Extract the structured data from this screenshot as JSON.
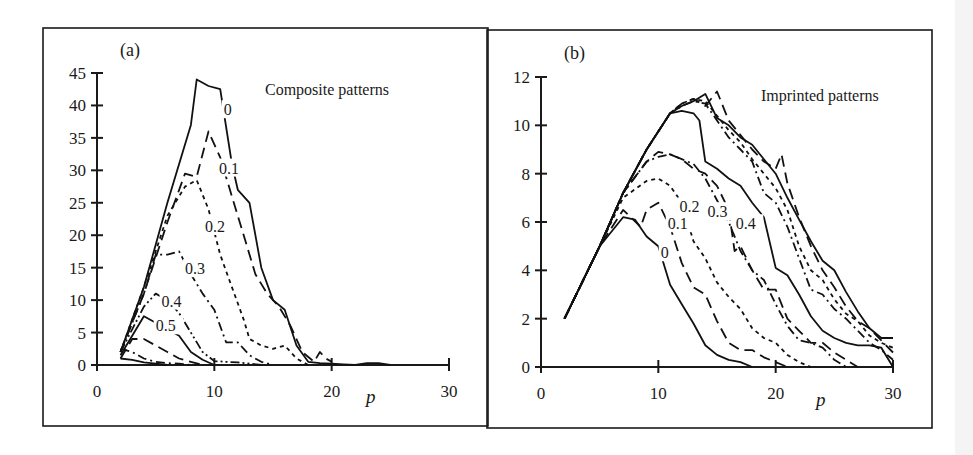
{
  "chart_data": [
    {
      "panel": "(a)",
      "type": "line",
      "title": "Composite patterns",
      "xlabel": "p",
      "ylabel": "",
      "xlim": [
        0,
        30
      ],
      "ylim": [
        0,
        45
      ],
      "xticks": [
        0,
        10,
        20,
        30
      ],
      "yticks": [
        0,
        5,
        10,
        15,
        20,
        25,
        30,
        35,
        40,
        45
      ],
      "grid": false,
      "legend": "inline curve labels",
      "series": [
        {
          "name": "0",
          "style": "solid",
          "label_pos": [
            10.8,
            38.5
          ],
          "x": [
            2,
            4,
            6,
            8,
            8.5,
            9.5,
            10.5,
            11.5,
            12,
            13,
            14,
            15,
            16,
            17,
            18,
            19,
            20,
            21,
            22,
            23,
            24,
            25
          ],
          "y": [
            2,
            12,
            25,
            37,
            44,
            43,
            42.5,
            31,
            27,
            25,
            15,
            10,
            8.5,
            3,
            0.5,
            0.3,
            0.2,
            0.1,
            0,
            0.3,
            0.3,
            0
          ]
        },
        {
          "name": "0.1",
          "style": "long-dash",
          "label_pos": [
            10.4,
            29.5
          ],
          "x": [
            2,
            4,
            6,
            7.5,
            8.5,
            9.5,
            10.5,
            11.5,
            12.5,
            13.5,
            14.5,
            15.5,
            16.5,
            17.5,
            18.5,
            19,
            19.5,
            20
          ],
          "y": [
            2,
            11,
            22,
            29.5,
            29,
            36,
            32,
            26,
            20,
            14,
            11,
            9,
            6,
            2,
            0.5,
            2,
            1,
            0.5
          ]
        },
        {
          "name": "0.2",
          "style": "short-dash",
          "label_pos": [
            9.2,
            20.5
          ],
          "x": [
            2,
            4,
            6,
            7.5,
            8.5,
            9.5,
            10.5,
            11.5,
            12.5,
            13,
            14,
            15,
            16,
            17,
            18
          ],
          "y": [
            2,
            12,
            23,
            27.5,
            28.5,
            24,
            17,
            12,
            7,
            4,
            3,
            2.5,
            3,
            1,
            0
          ]
        },
        {
          "name": "0.3",
          "style": "dash-dot",
          "label_pos": [
            7.5,
            14
          ],
          "x": [
            2,
            4,
            5,
            6,
            7,
            8,
            9,
            10,
            11,
            12,
            13,
            14,
            15
          ],
          "y": [
            2,
            11,
            17,
            17,
            17.5,
            14,
            11,
            8.5,
            3.5,
            3.5,
            1.5,
            0.5,
            0
          ]
        },
        {
          "name": "0.4",
          "style": "dash-dot-dot",
          "label_pos": [
            5.5,
            9
          ],
          "x": [
            2,
            3,
            4,
            5,
            6,
            7,
            8,
            9,
            10,
            11,
            12,
            13,
            14
          ],
          "y": [
            2,
            5.5,
            9,
            11,
            10,
            8,
            5,
            2,
            0.6,
            0.5,
            0.4,
            0.2,
            0
          ]
        },
        {
          "name": "0.5",
          "style": "solid",
          "label_pos": [
            5.0,
            5.2
          ],
          "x": [
            2,
            3,
            4,
            5,
            6,
            7,
            8,
            9,
            10
          ],
          "y": [
            1.5,
            4.5,
            7.5,
            6.5,
            5.5,
            4.5,
            2,
            0.8,
            0
          ]
        },
        {
          "name": "0.6",
          "style": "long-dash",
          "label_pos": null,
          "x": [
            2,
            3,
            4,
            5,
            6,
            7,
            8,
            9
          ],
          "y": [
            1,
            4,
            4,
            3,
            2,
            1,
            0.5,
            0
          ]
        },
        {
          "name": "0.7",
          "style": "dash-dot",
          "label_pos": null,
          "x": [
            2,
            3,
            4,
            5,
            6,
            7,
            8
          ],
          "y": [
            2.5,
            2,
            1,
            0.5,
            0.3,
            0.2,
            0
          ]
        },
        {
          "name": "0.8",
          "style": "solid",
          "label_pos": null,
          "x": [
            2,
            3,
            4,
            5,
            6
          ],
          "y": [
            1,
            0.8,
            0.4,
            0.2,
            0
          ]
        }
      ]
    },
    {
      "panel": "(b)",
      "type": "line",
      "title": "Imprinted patterns",
      "xlabel": "p",
      "ylabel": "",
      "xlim": [
        0,
        30
      ],
      "ylim": [
        0,
        12
      ],
      "xticks": [
        0,
        10,
        20,
        30
      ],
      "yticks": [
        0,
        2,
        4,
        6,
        8,
        10,
        12
      ],
      "grid": false,
      "legend": "inline curve labels",
      "series": [
        {
          "name": "0",
          "style": "solid",
          "label_pos": [
            10.2,
            4.5
          ],
          "x": [
            2,
            5,
            7,
            8,
            9,
            10,
            11,
            12,
            13,
            14,
            15,
            16,
            17,
            18
          ],
          "y": [
            2,
            5,
            6.2,
            6.1,
            5.4,
            5,
            3.4,
            2.6,
            1.8,
            0.9,
            0.5,
            0.3,
            0.2,
            0
          ]
        },
        {
          "name": "0.1",
          "style": "long-dash",
          "label_pos": [
            10.8,
            5.7
          ],
          "x": [
            2,
            5,
            7,
            8.5,
            9,
            10,
            11,
            12,
            13,
            14,
            15,
            16,
            17,
            18,
            19,
            20,
            21
          ],
          "y": [
            2,
            5,
            6.5,
            5.8,
            6.5,
            6.8,
            5.8,
            4.3,
            3.3,
            3.0,
            1.9,
            1.0,
            0.7,
            0.7,
            0.4,
            0.2,
            0
          ]
        },
        {
          "name": "0.2",
          "style": "short-dash",
          "label_pos": [
            11.8,
            6.4
          ],
          "x": [
            2,
            5,
            7,
            9,
            10,
            11,
            12,
            13,
            14,
            15,
            16,
            17,
            18,
            19,
            20,
            21,
            22,
            23
          ],
          "y": [
            2,
            5,
            7,
            7.7,
            7.8,
            7.5,
            6.8,
            5.2,
            4.5,
            3.5,
            2.9,
            2.4,
            1.6,
            1.2,
            1.0,
            0.5,
            0.2,
            0
          ]
        },
        {
          "name": "0.3",
          "style": "dash-dot",
          "label_pos": [
            14.2,
            6.2
          ],
          "x": [
            2,
            5,
            7,
            9,
            10,
            11,
            12,
            13,
            14,
            15,
            16,
            17,
            18,
            19,
            20,
            21,
            22,
            23,
            24,
            25,
            26
          ],
          "y": [
            2,
            5,
            7.2,
            8.5,
            8.7,
            8.8,
            8.6,
            8.4,
            7.8,
            6.9,
            6.0,
            4.8,
            4.0,
            3.6,
            2.6,
            1.7,
            1.1,
            1.0,
            0.8,
            0.3,
            0
          ]
        },
        {
          "name": "0.4",
          "style": "long-dash",
          "label_pos": [
            16.6,
            5.7
          ],
          "x": [
            2,
            5,
            7,
            9,
            10,
            11,
            12,
            13,
            14,
            15,
            16,
            16.5,
            17,
            18,
            19,
            20,
            21,
            22,
            23,
            24,
            25,
            26,
            27
          ],
          "y": [
            2,
            5,
            7.2,
            8.5,
            8.9,
            8.8,
            8.6,
            8.2,
            8.0,
            7.5,
            6.5,
            4.8,
            5.0,
            4.0,
            3.2,
            3.2,
            2.0,
            1.5,
            1.0,
            1.0,
            0.6,
            0.3,
            0
          ]
        },
        {
          "name": "0.5",
          "style": "solid",
          "label_pos": null,
          "x": [
            2,
            5,
            7,
            9,
            11,
            12,
            13,
            13.5,
            14,
            15,
            16,
            17,
            18,
            19,
            20,
            21,
            22,
            23,
            24,
            25,
            26,
            27,
            28,
            29,
            30
          ],
          "y": [
            2,
            5,
            7.2,
            9,
            10.5,
            10.6,
            10.5,
            10.2,
            8.5,
            8.2,
            7.8,
            7.5,
            6.8,
            6.2,
            4.1,
            3.8,
            3.0,
            2.1,
            1.5,
            1.2,
            1.0,
            0.9,
            0.9,
            0.8,
            0
          ]
        },
        {
          "name": "0.6",
          "style": "dash-dot",
          "label_pos": null,
          "x": [
            2,
            5,
            7,
            9,
            11,
            12,
            13,
            14,
            15,
            16,
            17,
            18,
            19,
            20,
            21,
            22,
            23,
            24,
            25,
            26,
            27,
            28,
            29,
            30
          ],
          "y": [
            2,
            5,
            7.2,
            9,
            10.5,
            10.8,
            11,
            10.9,
            10.2,
            9.5,
            9,
            8.5,
            7.2,
            6.8,
            5.8,
            4.5,
            3.2,
            3.0,
            2.4,
            2.0,
            1.5,
            1.0,
            0.7,
            0.3
          ]
        },
        {
          "name": "0.7",
          "style": "short-dash",
          "label_pos": null,
          "x": [
            2,
            5,
            7,
            9,
            11,
            12,
            13,
            14,
            15,
            16,
            17,
            18,
            19,
            20,
            21,
            22,
            23,
            24,
            25,
            26,
            27,
            28,
            29,
            30
          ],
          "y": [
            2,
            5,
            7.2,
            9,
            10.5,
            10.9,
            11.1,
            11.0,
            10.4,
            9.8,
            9.3,
            8.6,
            8.0,
            7.4,
            6.5,
            5.0,
            4.0,
            3.6,
            2.8,
            2.2,
            1.9,
            1.3,
            1.0,
            0.8
          ]
        },
        {
          "name": "0.8",
          "style": "solid",
          "label_pos": null,
          "x": [
            2,
            5,
            7,
            9,
            11,
            12,
            13,
            14,
            15,
            16,
            17,
            18,
            19,
            20,
            21,
            22,
            23,
            24,
            25,
            26,
            27,
            28,
            29,
            30
          ],
          "y": [
            2,
            5,
            7.2,
            9,
            10.5,
            10.8,
            11.0,
            11.3,
            10.3,
            10.0,
            9.5,
            9.2,
            8.6,
            8.0,
            7.0,
            6.1,
            5.2,
            4.4,
            4.0,
            3.1,
            2.3,
            1.6,
            1.2,
            1.2
          ]
        },
        {
          "name": "0.9",
          "style": "long-dash",
          "label_pos": null,
          "x": [
            2,
            5,
            7,
            9,
            11,
            12,
            13,
            14,
            15,
            16,
            17,
            18,
            19,
            20,
            20.5,
            21,
            22,
            23,
            24,
            25,
            26,
            27,
            28,
            29,
            30
          ],
          "y": [
            2,
            5,
            7.2,
            9,
            10.5,
            10.9,
            11.1,
            10.8,
            11.4,
            10.2,
            9.6,
            9.0,
            8.5,
            8.2,
            8.8,
            7.6,
            6.2,
            5.0,
            4.0,
            3.3,
            2.5,
            1.9,
            1.6,
            1.1,
            0.6
          ]
        }
      ]
    }
  ],
  "figure": {
    "panel_a": {
      "tag": "(a)",
      "title": "Composite patterns",
      "xlabel": "p",
      "yticks": [
        "0",
        "5",
        "10",
        "15",
        "20",
        "25",
        "30",
        "35",
        "40",
        "45"
      ],
      "xticks": [
        "0",
        "10",
        "20",
        "30"
      ],
      "curve_labels": [
        "0",
        "0.1",
        "0.2",
        "0.3",
        "0.4",
        "0.5"
      ]
    },
    "panel_b": {
      "tag": "(b)",
      "title": "Imprinted patterns",
      "xlabel": "p",
      "yticks": [
        "0",
        "2",
        "4",
        "6",
        "8",
        "10",
        "12"
      ],
      "xticks": [
        "0",
        "10",
        "20",
        "30"
      ],
      "curve_labels": [
        "0",
        "0.1",
        "0.2",
        "0.3",
        "0.4"
      ]
    }
  }
}
